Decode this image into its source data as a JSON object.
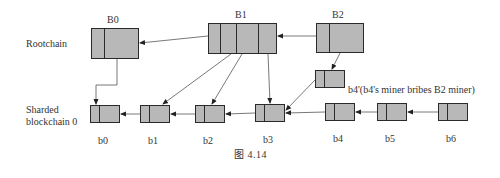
{
  "rows": {
    "rootchain_label": "Rootchain",
    "shard_label_line1": "Sharded",
    "shard_label_line2": "blockchain 0"
  },
  "root_blocks": [
    {
      "id": "B0",
      "label": "B0",
      "x": 91,
      "y": 28,
      "w": 48,
      "h": 31,
      "dividers": [
        104
      ]
    },
    {
      "id": "B1",
      "label": "B1",
      "x": 208,
      "y": 23,
      "w": 69,
      "h": 31,
      "dividers": [
        220,
        236,
        258
      ]
    },
    {
      "id": "B2",
      "label": "B2",
      "x": 316,
      "y": 23,
      "w": 48,
      "h": 30,
      "dividers": [
        329
      ]
    }
  ],
  "shard_blocks": [
    {
      "id": "b0",
      "label": "b0",
      "x": 90,
      "y": 105,
      "w": 30,
      "h": 18,
      "dividers": [
        99
      ]
    },
    {
      "id": "b1",
      "label": "b1",
      "x": 140,
      "y": 105,
      "w": 30,
      "h": 18,
      "dividers": [
        149
      ]
    },
    {
      "id": "b2",
      "label": "b2",
      "x": 195,
      "y": 105,
      "w": 30,
      "h": 18,
      "dividers": [
        204
      ]
    },
    {
      "id": "b3",
      "label": "b3",
      "x": 255,
      "y": 104,
      "w": 30,
      "h": 18,
      "dividers": [
        264
      ]
    },
    {
      "id": "b4",
      "label": "b4",
      "x": 325,
      "y": 103,
      "w": 30,
      "h": 18,
      "dividers": [
        334
      ]
    },
    {
      "id": "b5",
      "label": "b5",
      "x": 377,
      "y": 103,
      "w": 30,
      "h": 18,
      "dividers": [
        386
      ]
    },
    {
      "id": "b6",
      "label": "b6",
      "x": 438,
      "y": 103,
      "w": 30,
      "h": 18,
      "dividers": [
        447
      ]
    }
  ],
  "fork_block": {
    "id": "b4prime",
    "x": 315,
    "y": 70,
    "w": 30,
    "h": 18,
    "dividers": [
      324
    ]
  },
  "fork_note": "b4'(b4's miner bribes B2 miner)",
  "caption": "图 4.14",
  "colors": {
    "block_fill": "#b8b8b8",
    "stroke": "#2a2a2a",
    "line": "#555555"
  }
}
